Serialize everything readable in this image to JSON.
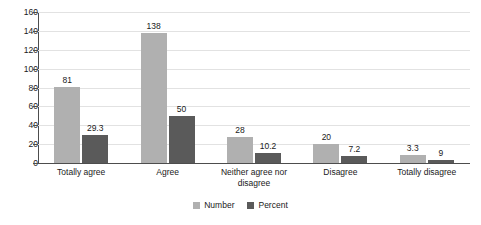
{
  "chart_data": {
    "type": "bar",
    "title": "",
    "subtitle": "",
    "xlabel": "",
    "ylabel": "",
    "ylim": [
      0,
      160
    ],
    "y_ticks": [
      0,
      20,
      40,
      60,
      80,
      100,
      120,
      140,
      160
    ],
    "grid": true,
    "legend_position": "bottom-center",
    "categories": [
      "Totally agree",
      "Agree",
      "Neither agree nor\ndisagree",
      "Disagree",
      "Totally disagree"
    ],
    "series": [
      {
        "name": "Number",
        "color": "#b0b0b0",
        "values": [
          81,
          138,
          28,
          20,
          9
        ],
        "labels": [
          "81",
          "138",
          "28",
          "20",
          "3.3"
        ]
      },
      {
        "name": "Percent",
        "color": "#5a5a5a",
        "values": [
          29.3,
          50,
          10.2,
          7.2,
          3.3
        ],
        "labels": [
          "29.3",
          "50",
          "10.2",
          "7.2",
          "9"
        ]
      }
    ]
  },
  "axis": {
    "y_tick_labels": [
      "160",
      "140",
      "120",
      "100",
      "80",
      "60",
      "40",
      "20",
      "0"
    ]
  },
  "legend": {
    "items": [
      {
        "label": "Number",
        "color": "#b0b0b0"
      },
      {
        "label": "Percent",
        "color": "#5a5a5a"
      }
    ]
  }
}
